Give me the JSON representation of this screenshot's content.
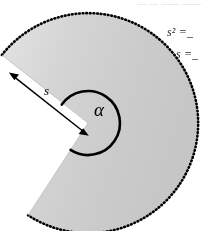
{
  "figure": {
    "type": "circular-sector-diagram",
    "fill_color": "#d2d2d2",
    "outline_color": "#000000",
    "background_color": "#ffffff",
    "apex": {
      "x": 88,
      "y": 123
    },
    "radius": 110,
    "inner_arc_radius": 32,
    "sector_start_angle_deg": 145,
    "sector_end_angle_deg": 237,
    "outer_arc_style": "dotted",
    "labels": {
      "radius_label": "s",
      "angle_label": "α"
    },
    "arrow": {
      "name": "radius-arrow",
      "style": "double-headed",
      "from": {
        "x": 88,
        "y": 123
      },
      "to": {
        "x": 12,
        "y": 57
      }
    }
  },
  "annotations": {
    "top_text": "— — —— ——",
    "formula_1": "s² = ̲",
    "formula_2": "s = ̲"
  }
}
